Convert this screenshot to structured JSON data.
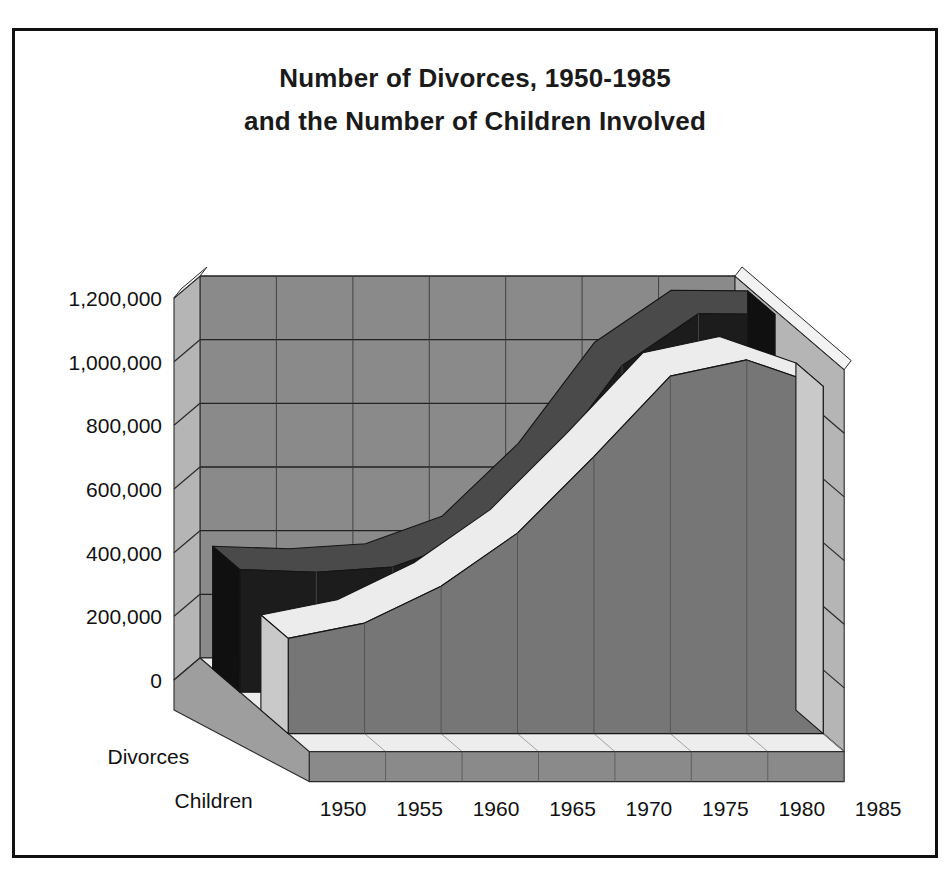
{
  "title": {
    "line1": "Number of Divorces,  1950-1985",
    "line2": "and the Number of Children Involved"
  },
  "axis": {
    "y_ticks": [
      "1,200,000",
      "1,000,000",
      "800,000",
      "600,000",
      "400,000",
      "200,000",
      "0"
    ],
    "x_ticks": [
      "1950",
      "1955",
      "1960",
      "1965",
      "1970",
      "1975",
      "1980",
      "1985"
    ],
    "series_labels": [
      "Divorces",
      "Children"
    ]
  },
  "colors": {
    "border": "#111111",
    "wall": "#8a8a8a",
    "wall_left": "#b5b5b5",
    "floor_top": "#ededed",
    "floor_front": "#8a8a8a",
    "divorces_top": "#4a4a4a",
    "divorces_front": "#1c1c1c",
    "divorces_side": "#101010",
    "children_top": "#ececec",
    "children_front": "#767676",
    "children_side": "#c9c9c9",
    "gridline": "#222222",
    "text": "#111111"
  },
  "chart_data": {
    "type": "area",
    "title": "Number of Divorces, 1950-1985 and the Number of Children Involved",
    "xlabel": "",
    "ylabel": "",
    "categories": [
      "1950",
      "1955",
      "1960",
      "1965",
      "1970",
      "1975",
      "1980",
      "1985"
    ],
    "series": [
      {
        "name": "Divorces",
        "values": [
          385000,
          377000,
          393000,
          479000,
          708000,
          1026000,
          1189000,
          1187000
        ]
      },
      {
        "name": "Children",
        "values": [
          299000,
          347000,
          463000,
          630000,
          870000,
          1123000,
          1174000,
          1091000
        ]
      }
    ],
    "ylim": [
      0,
      1200000
    ],
    "ytick_step": 200000,
    "grid": true,
    "legend": "axis-labels",
    "projection": "3d-ribbon"
  }
}
